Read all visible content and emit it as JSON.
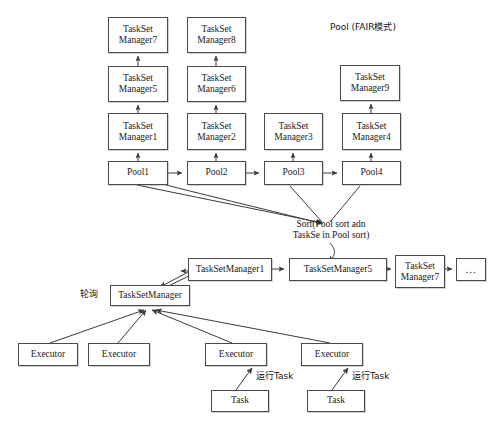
{
  "diagram": {
    "title_label": "Pool (FAIR模式)",
    "sort_label": "Sort(Pool sort adn\nTaskSe in Pool sort)",
    "polling_label": "轮询",
    "run_task_label_1": "运行Task",
    "run_task_label_2": "运行Task",
    "top_section": {
      "taskset_managers": [
        {
          "name": "taskset-manager-7",
          "label": "TaskSet\nManager7",
          "x": 108,
          "y": 17,
          "w": 60,
          "h": 36
        },
        {
          "name": "taskset-manager-8",
          "label": "TaskSet\nManager8",
          "x": 187,
          "y": 17,
          "w": 59,
          "h": 36
        },
        {
          "name": "taskset-manager-5",
          "label": "TaskSet\nManager5",
          "x": 108,
          "y": 66,
          "w": 60,
          "h": 36
        },
        {
          "name": "taskset-manager-6",
          "label": "TaskSet\nManager6",
          "x": 187,
          "y": 66,
          "w": 59,
          "h": 36
        },
        {
          "name": "taskset-manager-9",
          "label": "TaskSet\nManager9",
          "x": 340,
          "y": 65,
          "w": 60,
          "h": 36
        },
        {
          "name": "taskset-manager-1",
          "label": "TaskSet\nManager1",
          "x": 108,
          "y": 113,
          "w": 60,
          "h": 37
        },
        {
          "name": "taskset-manager-2",
          "label": "TaskSet\nManager2",
          "x": 187,
          "y": 113,
          "w": 59,
          "h": 37
        },
        {
          "name": "taskset-manager-3",
          "label": "TaskSet\nManager3",
          "x": 264,
          "y": 113,
          "w": 59,
          "h": 37
        },
        {
          "name": "taskset-manager-4",
          "label": "TaskSet\nManager4",
          "x": 342,
          "y": 113,
          "w": 59,
          "h": 37
        }
      ],
      "pools": [
        {
          "name": "pool-1",
          "label": "Pool1",
          "x": 108,
          "y": 161,
          "w": 60,
          "h": 24
        },
        {
          "name": "pool-2",
          "label": "Pool2",
          "x": 187,
          "y": 161,
          "w": 59,
          "h": 24
        },
        {
          "name": "pool-3",
          "label": "Pool3",
          "x": 264,
          "y": 161,
          "w": 59,
          "h": 24
        },
        {
          "name": "pool-4",
          "label": "Pool4",
          "x": 342,
          "y": 161,
          "w": 59,
          "h": 24
        }
      ]
    },
    "bottom_section": {
      "queue": [
        {
          "name": "queue-taskset-manager-1",
          "label": "TaskSetManager1",
          "x": 188,
          "y": 258,
          "w": 84,
          "h": 23
        },
        {
          "name": "queue-taskset-manager-5",
          "label": "TaskSetManager5",
          "x": 289,
          "y": 258,
          "w": 98,
          "h": 23
        },
        {
          "name": "queue-taskset-manager-7",
          "label": "TaskSet\nManager7",
          "x": 395,
          "y": 255,
          "w": 50,
          "h": 33
        },
        {
          "name": "queue-more",
          "label": "...",
          "x": 456,
          "y": 258,
          "w": 30,
          "h": 23
        }
      ],
      "scheduler": {
        "name": "active-taskset-manager",
        "label": "TaskSetManager",
        "x": 110,
        "y": 285,
        "w": 80,
        "h": 21
      },
      "executors": [
        {
          "name": "executor-1",
          "label": "Executor",
          "x": 18,
          "y": 343,
          "w": 60,
          "h": 23
        },
        {
          "name": "executor-2",
          "label": "Executor",
          "x": 88,
          "y": 343,
          "w": 62,
          "h": 23
        },
        {
          "name": "executor-3",
          "label": "Executor",
          "x": 205,
          "y": 343,
          "w": 62,
          "h": 23
        },
        {
          "name": "executor-4",
          "label": "Executor",
          "x": 301,
          "y": 343,
          "w": 62,
          "h": 23
        }
      ],
      "tasks": [
        {
          "name": "task-1",
          "label": "Task",
          "x": 211,
          "y": 390,
          "w": 58,
          "h": 22
        },
        {
          "name": "task-2",
          "label": "Task",
          "x": 307,
          "y": 390,
          "w": 58,
          "h": 22
        }
      ]
    },
    "colors": {
      "stroke": "#4a4a4a",
      "edge": "#3a3a3a",
      "text": "#1a1a1a",
      "background": "#ffffff"
    }
  }
}
